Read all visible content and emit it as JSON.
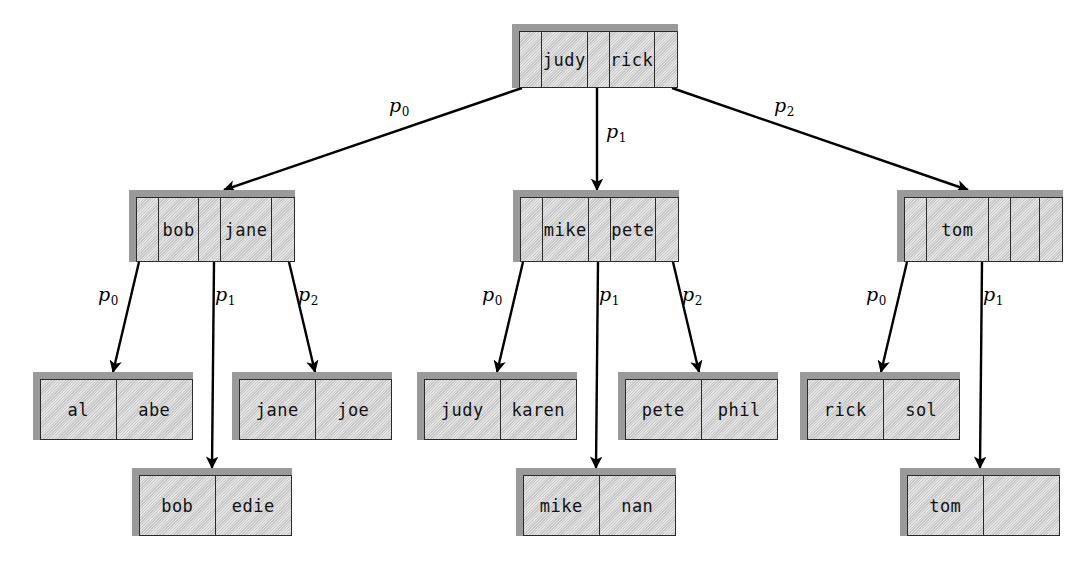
{
  "diagram": {
    "colors": {
      "node_face": "#d2d2d2",
      "node_shadow": "#9a9a9a",
      "node_border": "#2b2b2b",
      "arrow": "#000000",
      "background": "#ffffff"
    },
    "empty_cell": ""
  },
  "nodes": {
    "root": {
      "keys": [
        "judy",
        "rick"
      ],
      "pointers": [
        "p0",
        "p1",
        "p2"
      ]
    },
    "internal1": {
      "keys": [
        "bob",
        "jane"
      ],
      "pointers": [
        "p0",
        "p1",
        "p2"
      ]
    },
    "internal2": {
      "keys": [
        "mike",
        "pete"
      ],
      "pointers": [
        "p0",
        "p1",
        "p2"
      ]
    },
    "internal3": {
      "keys": [
        "tom",
        ""
      ],
      "pointers": [
        "p0",
        "p1"
      ]
    },
    "leaf1": {
      "keys": [
        "al",
        "abe"
      ]
    },
    "leaf2": {
      "keys": [
        "bob",
        "edie"
      ]
    },
    "leaf3": {
      "keys": [
        "jane",
        "joe"
      ]
    },
    "leaf4": {
      "keys": [
        "judy",
        "karen"
      ]
    },
    "leaf5": {
      "keys": [
        "mike",
        "nan"
      ]
    },
    "leaf6": {
      "keys": [
        "pete",
        "phil"
      ]
    },
    "leaf7": {
      "keys": [
        "rick",
        "sol"
      ]
    },
    "leaf8": {
      "keys": [
        "tom",
        ""
      ]
    }
  },
  "pointer_labels": {
    "root_p0": "p",
    "root_p0_sub": "0",
    "root_p1": "p",
    "root_p1_sub": "1",
    "root_p2": "p",
    "root_p2_sub": "2",
    "n1_p0": "p",
    "n1_p0_sub": "0",
    "n1_p1": "p",
    "n1_p1_sub": "1",
    "n1_p2": "p",
    "n1_p2_sub": "2",
    "n2_p0": "p",
    "n2_p0_sub": "0",
    "n2_p1": "p",
    "n2_p1_sub": "1",
    "n2_p2": "p",
    "n2_p2_sub": "2",
    "n3_p0": "p",
    "n3_p0_sub": "0",
    "n3_p1": "p",
    "n3_p1_sub": "1"
  },
  "edges": [
    {
      "from": "root",
      "pointer": "p0",
      "to": "internal1"
    },
    {
      "from": "root",
      "pointer": "p1",
      "to": "internal2"
    },
    {
      "from": "root",
      "pointer": "p2",
      "to": "internal3"
    },
    {
      "from": "internal1",
      "pointer": "p0",
      "to": "leaf1"
    },
    {
      "from": "internal1",
      "pointer": "p1",
      "to": "leaf2"
    },
    {
      "from": "internal1",
      "pointer": "p2",
      "to": "leaf3"
    },
    {
      "from": "internal2",
      "pointer": "p0",
      "to": "leaf4"
    },
    {
      "from": "internal2",
      "pointer": "p1",
      "to": "leaf5"
    },
    {
      "from": "internal2",
      "pointer": "p2",
      "to": "leaf6"
    },
    {
      "from": "internal3",
      "pointer": "p0",
      "to": "leaf7"
    },
    {
      "from": "internal3",
      "pointer": "p1",
      "to": "leaf8"
    }
  ]
}
